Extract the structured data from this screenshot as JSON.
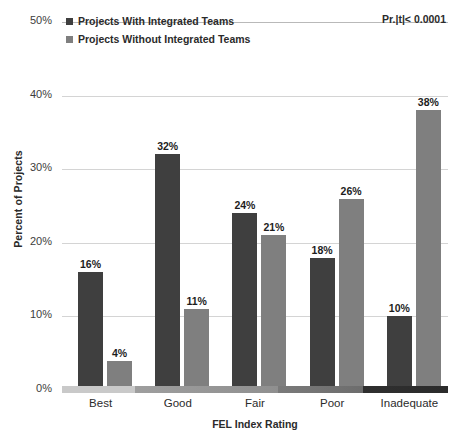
{
  "chart_data": {
    "type": "bar",
    "title": "",
    "xlabel": "FEL Index Rating",
    "ylabel": "Percent of Projects",
    "categories": [
      "Best",
      "Good",
      "Fair",
      "Poor",
      "Inadequate"
    ],
    "series": [
      {
        "name": "Projects With Integrated Teams",
        "color": "#3f3f3f",
        "values": [
          16,
          32,
          24,
          18,
          10
        ],
        "labels": [
          "16%",
          "32%",
          "24%",
          "18%",
          "10%"
        ]
      },
      {
        "name": "Projects Without Integrated Teams",
        "color": "#7f7f7f",
        "values": [
          4,
          11,
          21,
          26,
          38
        ],
        "labels": [
          "4%",
          "11%",
          "21%",
          "26%",
          "38%"
        ]
      }
    ],
    "ylim": [
      0,
      50
    ],
    "yticks": [
      0,
      10,
      20,
      30,
      40,
      50
    ],
    "ytick_labels": [
      "0%",
      "10%",
      "20%",
      "30%",
      "40%",
      "50%"
    ],
    "grid": true,
    "legend_position": "top-left",
    "annotations": [
      {
        "name": "p-value",
        "text": "Pr.|t|< 0.0001",
        "position": "top-right"
      }
    ]
  }
}
